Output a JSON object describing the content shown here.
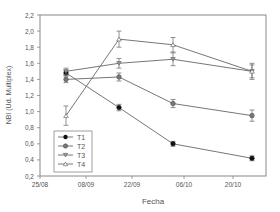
{
  "chart_data": {
    "type": "line",
    "title": "",
    "xlabel": "Fecha",
    "ylabel": "NBI (Ud. Multiplex)",
    "ylim": [
      0.2,
      2.2
    ],
    "yticks": [
      "0,2",
      "0,4",
      "0,6",
      "0,8",
      "1,0",
      "1,2",
      "1,4",
      "1,6",
      "1,8",
      "2,0",
      "2,2"
    ],
    "xticks": [
      "25/08",
      "08/09",
      "22/09",
      "06/10",
      "20/10"
    ],
    "x": [
      "02/09",
      "18/09",
      "03/10",
      "25/10"
    ],
    "grid": false,
    "legend_position": "lower left inside",
    "series": [
      {
        "name": "T1",
        "marker": "filled-circle",
        "values": [
          1.48,
          1.05,
          0.6,
          0.42
        ],
        "errors": [
          0.03,
          0.04,
          0.03,
          0.03
        ]
      },
      {
        "name": "T2",
        "marker": "gray-circle",
        "values": [
          1.4,
          1.43,
          1.1,
          0.95
        ],
        "errors": [
          0.04,
          0.05,
          0.05,
          0.07
        ]
      },
      {
        "name": "T3",
        "marker": "down-triangle",
        "values": [
          1.5,
          1.6,
          1.65,
          1.5
        ],
        "errors": [
          0.04,
          0.06,
          0.08,
          0.08
        ]
      },
      {
        "name": "T4",
        "marker": "up-triangle-open",
        "values": [
          0.95,
          1.9,
          1.83,
          1.5
        ],
        "errors": [
          0.12,
          0.1,
          0.09,
          0.1
        ]
      }
    ]
  },
  "legend": {
    "t1": "T1",
    "t2": "T2",
    "t3": "T3",
    "t4": "T4"
  },
  "axes": {
    "xlabel": "Fecha",
    "ylabel": "NBI (Ud. Multiplex)"
  }
}
